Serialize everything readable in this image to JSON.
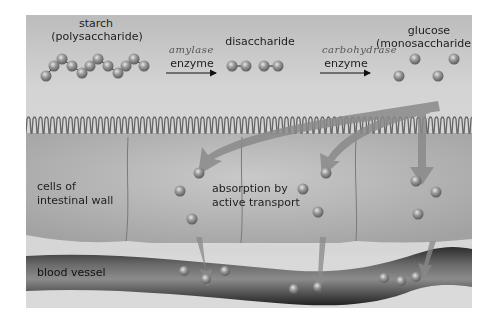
{
  "diagram": {
    "stages": [
      {
        "name": "starch",
        "sub": "(polysaccharide)"
      },
      {
        "name": "disaccharide"
      },
      {
        "name": "glucose",
        "sub": "(monosaccharide)"
      }
    ],
    "enzymes": [
      {
        "label": "enzyme",
        "handwritten": "amylase"
      },
      {
        "label": "enzyme",
        "handwritten": "carbohydrase"
      }
    ],
    "labels": {
      "cells": [
        "cells of",
        "intestinal wall"
      ],
      "absorption": [
        "absorption by",
        "active transport"
      ],
      "blood_vessel": "blood vessel"
    },
    "colors": {
      "background": "#d2d2d2",
      "cell": "#b0b0b0",
      "molecule": "#8a8a8a",
      "arrow": "#7a7a7a",
      "vessel": "#4a4a4a"
    }
  }
}
